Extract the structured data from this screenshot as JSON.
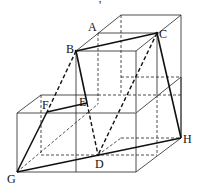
{
  "figure": {
    "caption_mark": "'",
    "points": {
      "A": {
        "label": "A",
        "x": 98,
        "y": 33
      },
      "B": {
        "label": "B",
        "x": 76,
        "y": 51
      },
      "C": {
        "label": "C",
        "x": 157,
        "y": 33
      },
      "D": {
        "label": "D",
        "x": 98,
        "y": 155
      },
      "E": {
        "label": "E",
        "x": 87,
        "y": 103
      },
      "F": {
        "label": "F",
        "x": 47,
        "y": 112
      },
      "G": {
        "label": "G",
        "x": 17,
        "y": 172
      },
      "H": {
        "label": "H",
        "x": 181,
        "y": 138
      }
    }
  }
}
